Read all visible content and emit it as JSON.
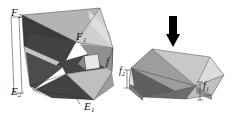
{
  "figure": {
    "background_color": "#ffffff",
    "width": 245,
    "height": 127,
    "ink_color": "#111111",
    "arrow_color": "#000000"
  },
  "palette": {
    "dark_facet": "#3b3b3b",
    "dark_facet_2": "#474747",
    "mid_dark_facet": "#5e5e5e",
    "mid_facet": "#7d7d7d",
    "mid_light_facet": "#9a9a9a",
    "light_facet": "#bdbdbd",
    "lighter_facet": "#d2d2d2",
    "lightest_facet": "#e4e4e4",
    "highlight_facet": "#f0f0f0",
    "edge_line": "#2a2a2a",
    "thin_rule": "#555555"
  },
  "left_figure": {
    "name": "expanded-star-polyhedron",
    "caption": "Non-convex star polyhedron in expanded state",
    "labels": [
      {
        "id": "F2",
        "base": "F",
        "sub": "2",
        "text": "F2"
      },
      {
        "id": "F1",
        "base": "F",
        "sub": "1",
        "text": "F1"
      },
      {
        "id": "E2",
        "base": "E",
        "sub": "2",
        "text": "E2"
      },
      {
        "id": "E1",
        "base": "E",
        "sub": "1",
        "text": "E1"
      },
      {
        "id": "edge",
        "base": "f",
        "sub": "",
        "text": "f"
      }
    ]
  },
  "right_figure": {
    "name": "compressed-polyhedron",
    "caption": "Same polyhedron in compressed (flexed) state",
    "labels": [
      {
        "id": "f2",
        "base": "f",
        "sub": "2",
        "text": "f2"
      },
      {
        "id": "f1",
        "base": "f",
        "sub": "1",
        "text": "f1"
      }
    ]
  },
  "arrow": {
    "name": "compression-arrow",
    "direction": "down",
    "meaning": "applied compression"
  },
  "measures": {
    "f1": {
      "label_base": "f",
      "label_sub": "1",
      "description": "right-side height measure"
    },
    "f2": {
      "label_base": "f",
      "label_sub": "2",
      "description": "left-side height measure"
    }
  }
}
